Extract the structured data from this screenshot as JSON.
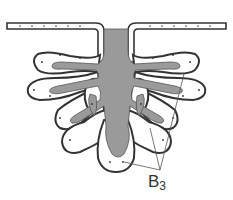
{
  "diagram": {
    "colors": {
      "lumen": "#9a9a9a",
      "outline": "#333333",
      "cell_fill": "#ffffff",
      "pointer_line": "#555555"
    },
    "labels": [
      {
        "id": "B3",
        "main": "B",
        "sub": "3"
      }
    ]
  }
}
